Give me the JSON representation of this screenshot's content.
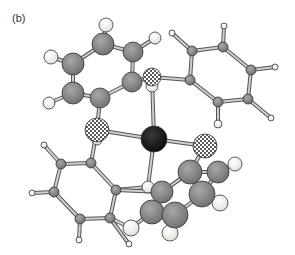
{
  "figure": {
    "panel_label": "(b)",
    "colors": {
      "metal": "#1a1a1a",
      "carbon": "#8c8c8c",
      "hydrogen": "#f0f0ea",
      "bond": "#cfcfcf",
      "bond_outline": "#555555",
      "heteroatom_pattern": "#222222"
    }
  },
  "atoms": [
    {
      "id": "M",
      "type": "metal",
      "x": 154,
      "y": 139,
      "r": 13
    },
    {
      "id": "X1",
      "type": "hetero",
      "x": 152,
      "y": 77,
      "r": 9
    },
    {
      "id": "X2",
      "type": "hetero",
      "x": 97,
      "y": 130,
      "r": 12
    },
    {
      "id": "X3",
      "type": "hetero",
      "x": 205,
      "y": 146,
      "r": 12
    },
    {
      "id": "X4",
      "type": "hetero-h",
      "x": 148,
      "y": 187,
      "r": 6
    },
    {
      "id": "A1",
      "type": "C",
      "x": 103,
      "y": 44,
      "r": 11
    },
    {
      "id": "A2",
      "type": "C",
      "x": 133,
      "y": 52,
      "r": 10
    },
    {
      "id": "A3",
      "type": "C",
      "x": 132,
      "y": 82,
      "r": 10
    },
    {
      "id": "A4",
      "type": "C",
      "x": 100,
      "y": 98,
      "r": 10
    },
    {
      "id": "A5",
      "type": "C",
      "x": 73,
      "y": 93,
      "r": 11
    },
    {
      "id": "A6",
      "type": "C",
      "x": 73,
      "y": 64,
      "r": 11
    },
    {
      "id": "AH1",
      "type": "H",
      "x": 106,
      "y": 25,
      "r": 7
    },
    {
      "id": "AH2",
      "type": "H",
      "x": 155,
      "y": 38,
      "r": 6
    },
    {
      "id": "AH3",
      "type": "H",
      "x": 51,
      "y": 57,
      "r": 7
    },
    {
      "id": "AH4",
      "type": "H",
      "x": 49,
      "y": 103,
      "r": 6
    },
    {
      "id": "XH1",
      "type": "H",
      "x": 152,
      "y": 86,
      "r": 6
    },
    {
      "id": "B1",
      "type": "C",
      "x": 190,
      "y": 80,
      "r": 5
    },
    {
      "id": "B2",
      "type": "C",
      "x": 192,
      "y": 51,
      "r": 5
    },
    {
      "id": "B3",
      "type": "C",
      "x": 223,
      "y": 47,
      "r": 5
    },
    {
      "id": "B4",
      "type": "C",
      "x": 251,
      "y": 70,
      "r": 5
    },
    {
      "id": "B5",
      "type": "C",
      "x": 248,
      "y": 99,
      "r": 5
    },
    {
      "id": "B6",
      "type": "C",
      "x": 218,
      "y": 102,
      "r": 5
    },
    {
      "id": "BH1",
      "type": "H",
      "x": 172,
      "y": 33,
      "r": 3
    },
    {
      "id": "BH2",
      "type": "H",
      "x": 224,
      "y": 26,
      "r": 3
    },
    {
      "id": "BH3",
      "type": "H",
      "x": 275,
      "y": 67,
      "r": 3
    },
    {
      "id": "BH4",
      "type": "H",
      "x": 271,
      "y": 118,
      "r": 3
    },
    {
      "id": "BH5",
      "type": "H",
      "x": 218,
      "y": 124,
      "r": 4
    },
    {
      "id": "C1",
      "type": "C",
      "x": 91,
      "y": 163,
      "r": 5
    },
    {
      "id": "C2",
      "type": "C",
      "x": 61,
      "y": 164,
      "r": 5
    },
    {
      "id": "C3",
      "type": "C",
      "x": 54,
      "y": 192,
      "r": 5
    },
    {
      "id": "C4",
      "type": "C",
      "x": 80,
      "y": 219,
      "r": 5
    },
    {
      "id": "C5",
      "type": "C",
      "x": 110,
      "y": 218,
      "r": 5
    },
    {
      "id": "C6",
      "type": "C",
      "x": 116,
      "y": 190,
      "r": 5
    },
    {
      "id": "CH1",
      "type": "H",
      "x": 44,
      "y": 145,
      "r": 3
    },
    {
      "id": "CH2",
      "type": "H",
      "x": 32,
      "y": 193,
      "r": 3
    },
    {
      "id": "CH3",
      "type": "H",
      "x": 79,
      "y": 240,
      "r": 3
    },
    {
      "id": "CH4",
      "type": "H",
      "x": 129,
      "y": 244,
      "r": 3
    },
    {
      "id": "XH2",
      "type": "H",
      "x": 97,
      "y": 140,
      "r": 5
    },
    {
      "id": "D1",
      "type": "C",
      "x": 162,
      "y": 192,
      "r": 11
    },
    {
      "id": "D2",
      "type": "C",
      "x": 152,
      "y": 212,
      "r": 12
    },
    {
      "id": "D3",
      "type": "C",
      "x": 175,
      "y": 215,
      "r": 13
    },
    {
      "id": "D4",
      "type": "C",
      "x": 202,
      "y": 194,
      "r": 13
    },
    {
      "id": "D5",
      "type": "C",
      "x": 190,
      "y": 172,
      "r": 12
    },
    {
      "id": "D6",
      "type": "C",
      "x": 218,
      "y": 172,
      "r": 11
    },
    {
      "id": "DH1",
      "type": "H",
      "x": 131,
      "y": 228,
      "r": 8
    },
    {
      "id": "DH2",
      "type": "H",
      "x": 170,
      "y": 233,
      "r": 8
    },
    {
      "id": "DH3",
      "type": "H",
      "x": 220,
      "y": 203,
      "r": 8
    },
    {
      "id": "DH4",
      "type": "H",
      "x": 235,
      "y": 164,
      "r": 7
    }
  ],
  "bonds": [
    [
      "M",
      "X1"
    ],
    [
      "M",
      "X2"
    ],
    [
      "M",
      "X3"
    ],
    [
      "M",
      "X4"
    ],
    [
      "X1",
      "B1"
    ],
    [
      "X1",
      "A3"
    ],
    [
      "X1",
      "XH1"
    ],
    [
      "A1",
      "A2"
    ],
    [
      "A2",
      "A3"
    ],
    [
      "A3",
      "A4"
    ],
    [
      "A4",
      "A5"
    ],
    [
      "A5",
      "A6"
    ],
    [
      "A6",
      "A1"
    ],
    [
      "A1",
      "AH1"
    ],
    [
      "A2",
      "AH2"
    ],
    [
      "A6",
      "AH3"
    ],
    [
      "A5",
      "AH4"
    ],
    [
      "A4",
      "X2"
    ],
    [
      "B1",
      "B2"
    ],
    [
      "B2",
      "B3"
    ],
    [
      "B3",
      "B4"
    ],
    [
      "B4",
      "B5"
    ],
    [
      "B5",
      "B6"
    ],
    [
      "B6",
      "B1"
    ],
    [
      "B2",
      "BH1"
    ],
    [
      "B3",
      "BH2"
    ],
    [
      "B4",
      "BH3"
    ],
    [
      "B5",
      "BH4"
    ],
    [
      "B6",
      "BH5"
    ],
    [
      "X2",
      "C1"
    ],
    [
      "X2",
      "XH2"
    ],
    [
      "C1",
      "C2"
    ],
    [
      "C2",
      "C3"
    ],
    [
      "C3",
      "C4"
    ],
    [
      "C4",
      "C5"
    ],
    [
      "C5",
      "C6"
    ],
    [
      "C6",
      "C1"
    ],
    [
      "C2",
      "CH1"
    ],
    [
      "C3",
      "CH2"
    ],
    [
      "C4",
      "CH3"
    ],
    [
      "C5",
      "CH4"
    ],
    [
      "C5",
      "DH1"
    ],
    [
      "C6",
      "X4"
    ],
    [
      "C6",
      "D1"
    ],
    [
      "X3",
      "D5"
    ],
    [
      "D1",
      "D2"
    ],
    [
      "D2",
      "D3"
    ],
    [
      "D3",
      "D4"
    ],
    [
      "D4",
      "D6"
    ],
    [
      "D6",
      "D5"
    ],
    [
      "D5",
      "D1"
    ],
    [
      "D2",
      "DH1"
    ],
    [
      "D3",
      "DH2"
    ],
    [
      "D4",
      "DH3"
    ],
    [
      "D6",
      "DH4"
    ]
  ]
}
